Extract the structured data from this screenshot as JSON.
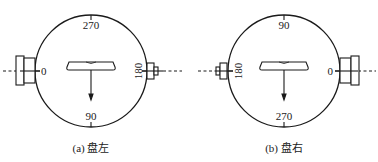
{
  "figure": {
    "panels": [
      {
        "id": "a",
        "caption": "(a) 盘左",
        "ticks": {
          "top": "270",
          "bottom": "90",
          "left": "0",
          "right": "180"
        },
        "large_knob_side": "left",
        "small_knob_side": "right"
      },
      {
        "id": "b",
        "caption": "(b) 盘右",
        "ticks": {
          "top": "90",
          "bottom": "270",
          "left": "180",
          "right": "0"
        },
        "large_knob_side": "right",
        "small_knob_side": "left"
      }
    ],
    "stroke_color": "#1a1a1a"
  }
}
